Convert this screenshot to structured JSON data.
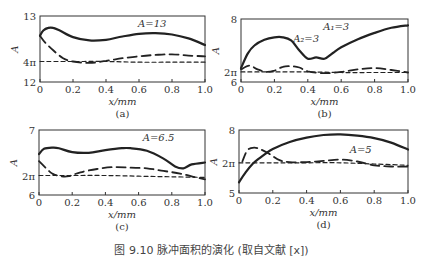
{
  "figure_caption": "图 9.10 脉冲面积的演化 (取自文献 [x])",
  "chart_data": [
    {
      "type": "line",
      "panel": "(a)",
      "xlabel": "x/mm",
      "ylabel": "A",
      "xlim": [
        0,
        1.0
      ],
      "ylim": [
        0,
        10
      ],
      "x_ticks": [
        0,
        0.2,
        0.4,
        0.6,
        0.8,
        1.0
      ],
      "x_tick_labels": [
        "0",
        "0.2",
        "0.4",
        "0.6",
        "0.8",
        "1.0"
      ],
      "y_ticks": [
        0,
        3.1,
        10
      ],
      "y_tick_labels": [
        "12",
        "4π",
        "13"
      ],
      "annotations": [
        {
          "text": "A=13",
          "x": 0.68,
          "y": 8.4
        }
      ],
      "series": [
        {
          "name": "solid",
          "style": "solid",
          "x": [
            0,
            0.02,
            0.05,
            0.08,
            0.12,
            0.2,
            0.3,
            0.4,
            0.5,
            0.6,
            0.7,
            0.8,
            0.9,
            1.0
          ],
          "y": [
            7.0,
            7.8,
            8.2,
            8.2,
            7.8,
            6.8,
            6.3,
            6.4,
            6.9,
            7.3,
            7.4,
            7.2,
            6.6,
            5.6
          ]
        },
        {
          "name": "long-dash",
          "style": "dashed",
          "x": [
            0,
            0.03,
            0.08,
            0.14,
            0.2,
            0.3,
            0.4,
            0.5,
            0.6,
            0.7,
            0.8,
            0.9,
            1.0
          ],
          "y": [
            7.0,
            6.0,
            4.8,
            3.6,
            3.1,
            2.9,
            3.2,
            3.6,
            3.9,
            4.1,
            4.2,
            4.0,
            3.9
          ]
        },
        {
          "name": "short-dash",
          "style": "dotted",
          "x": [
            0,
            0.2,
            0.4,
            0.6,
            0.8,
            1.0
          ],
          "y": [
            3.1,
            3.1,
            3.1,
            3.0,
            3.0,
            3.0
          ]
        }
      ]
    },
    {
      "type": "line",
      "panel": "(b)",
      "xlabel": "x/mm",
      "ylabel": "A",
      "xlim": [
        0,
        1.0
      ],
      "ylim": [
        0,
        10
      ],
      "x_ticks": [
        0,
        0.2,
        0.4,
        0.6,
        0.8,
        1.0
      ],
      "x_tick_labels": [
        "0",
        "0.2",
        "0.4",
        "0.6",
        "0.8",
        "1.0"
      ],
      "y_ticks": [
        0,
        1.6,
        10
      ],
      "y_tick_labels": [
        "6",
        "2π",
        "8"
      ],
      "annotations": [
        {
          "text": "A₁=3",
          "x": 0.57,
          "y": 8.3
        },
        {
          "text": "A₂=3",
          "x": 0.39,
          "y": 6.3
        }
      ],
      "series": [
        {
          "name": "solid",
          "style": "solid",
          "x": [
            0,
            0.04,
            0.08,
            0.14,
            0.2,
            0.25,
            0.3,
            0.35,
            0.4,
            0.45,
            0.5,
            0.55,
            0.6,
            0.7,
            0.8,
            0.9,
            1.0
          ],
          "y": [
            2.2,
            4.5,
            5.8,
            6.7,
            7.1,
            7.1,
            6.6,
            5.0,
            3.7,
            3.9,
            3.7,
            4.6,
            5.5,
            6.8,
            7.8,
            8.6,
            9.0
          ]
        },
        {
          "name": "long-dash",
          "style": "dashed",
          "x": [
            0,
            0.05,
            0.1,
            0.15,
            0.2,
            0.25,
            0.3,
            0.35,
            0.4,
            0.5,
            0.6,
            0.7,
            0.8,
            0.9,
            1.0
          ],
          "y": [
            2.0,
            2.6,
            2.0,
            1.6,
            1.8,
            2.4,
            2.5,
            2.3,
            1.7,
            1.4,
            1.6,
            2.0,
            2.2,
            1.9,
            1.5
          ]
        },
        {
          "name": "short-dash",
          "style": "dotted",
          "x": [
            0,
            0.2,
            0.4,
            0.6,
            0.8,
            1.0
          ],
          "y": [
            1.6,
            1.6,
            1.6,
            1.5,
            1.5,
            1.5
          ]
        }
      ]
    },
    {
      "type": "line",
      "panel": "(c)",
      "xlabel": "x/mm",
      "ylabel": "A",
      "xlim": [
        0,
        1.0
      ],
      "ylim": [
        0,
        10
      ],
      "x_ticks": [
        0,
        0.2,
        0.4,
        0.6,
        0.8,
        1.0
      ],
      "x_tick_labels": [
        "0",
        "0.2",
        "0.4",
        "0.6",
        "0.8",
        "1.0"
      ],
      "y_ticks": [
        0,
        3.0,
        10
      ],
      "y_tick_labels": [
        "6",
        "2π",
        "7"
      ],
      "annotations": [
        {
          "text": "A=6.5",
          "x": 0.72,
          "y": 8.3
        }
      ],
      "series": [
        {
          "name": "solid",
          "style": "solid",
          "x": [
            0,
            0.03,
            0.08,
            0.12,
            0.2,
            0.3,
            0.4,
            0.5,
            0.55,
            0.65,
            0.75,
            0.82,
            0.87,
            0.92,
            1.0
          ],
          "y": [
            6.3,
            7.1,
            7.3,
            7.2,
            6.6,
            6.5,
            6.9,
            7.2,
            7.2,
            6.8,
            5.6,
            4.4,
            4.1,
            4.7,
            5.0
          ]
        },
        {
          "name": "long-dash",
          "style": "dashed",
          "x": [
            0,
            0.04,
            0.08,
            0.13,
            0.18,
            0.25,
            0.35,
            0.45,
            0.55,
            0.65,
            0.75,
            0.85,
            0.93,
            1.0
          ],
          "y": [
            5.2,
            4.2,
            3.3,
            2.9,
            2.9,
            3.5,
            4.0,
            4.3,
            4.2,
            4.1,
            3.7,
            3.3,
            2.8,
            2.4
          ]
        },
        {
          "name": "short-dash",
          "style": "dotted",
          "x": [
            0,
            0.2,
            0.4,
            0.6,
            0.8,
            1.0
          ],
          "y": [
            3.0,
            3.0,
            3.0,
            2.9,
            2.8,
            2.7
          ]
        }
      ]
    },
    {
      "type": "line",
      "panel": "(d)",
      "xlabel": "x/mm",
      "ylabel": "A",
      "xlim": [
        0,
        1.0
      ],
      "ylim": [
        0,
        10
      ],
      "x_ticks": [
        0,
        0.2,
        0.4,
        0.6,
        0.8,
        1.0
      ],
      "x_tick_labels": [
        "0",
        "0.2",
        "0.4",
        "0.6",
        "0.8",
        "1.0"
      ],
      "y_ticks": [
        0,
        4.8,
        10
      ],
      "y_tick_labels": [
        "5",
        "2π",
        "8"
      ],
      "annotations": [
        {
          "text": "A=5",
          "x": 0.72,
          "y": 6.3
        }
      ],
      "series": [
        {
          "name": "solid",
          "style": "solid",
          "x": [
            0,
            0.04,
            0.08,
            0.12,
            0.16,
            0.2,
            0.3,
            0.4,
            0.5,
            0.6,
            0.7,
            0.8,
            0.9,
            1.0
          ],
          "y": [
            1.7,
            3.3,
            4.6,
            5.5,
            6.3,
            7.0,
            8.1,
            8.8,
            9.2,
            9.3,
            9.1,
            8.7,
            8.0,
            6.9
          ]
        },
        {
          "name": "long-dash",
          "style": "dashed",
          "x": [
            0.02,
            0.05,
            0.09,
            0.13,
            0.18,
            0.24,
            0.3,
            0.4,
            0.5,
            0.6,
            0.7,
            0.8,
            0.9,
            1.0
          ],
          "y": [
            5.0,
            6.8,
            7.2,
            6.9,
            6.2,
            5.2,
            4.9,
            4.9,
            5.1,
            5.3,
            5.0,
            4.4,
            4.2,
            4.2
          ]
        },
        {
          "name": "short-dash",
          "style": "dotted",
          "x": [
            0,
            0.2,
            0.4,
            0.6,
            0.8,
            1.0
          ],
          "y": [
            4.8,
            4.8,
            4.8,
            4.8,
            4.6,
            4.4
          ]
        }
      ]
    }
  ]
}
